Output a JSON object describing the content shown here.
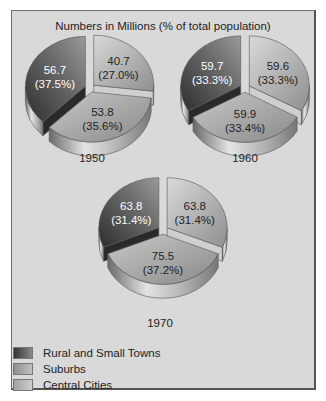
{
  "chart_data": {
    "type": "pie",
    "title": "Numbers in Millions (% of total population)",
    "legend_position": "bottom-left",
    "categories": [
      "Rural and Small Towns",
      "Suburbs",
      "Central Cities"
    ],
    "colors": {
      "Rural and Small Towns": "#4a4a4a",
      "Suburbs": "#a8a8a8",
      "Central Cities": "#bdbdbd"
    },
    "pies": [
      {
        "year": "1950",
        "values": [
          56.7,
          53.8,
          40.7
        ],
        "percents": [
          "37.5%",
          "35.6%",
          "27.0%"
        ]
      },
      {
        "year": "1960",
        "values": [
          59.7,
          59.9,
          59.6
        ],
        "percents": [
          "33.3%",
          "33.4%",
          "33.3%"
        ]
      },
      {
        "year": "1970",
        "values": [
          63.8,
          75.5,
          63.8
        ],
        "percents": [
          "31.4%",
          "37.2%",
          "31.4%"
        ]
      }
    ]
  },
  "title": "Numbers in Millions (% of total population)",
  "pies": [
    {
      "year": "1950",
      "rural": {
        "value": "56.7",
        "pct": "(37.5%)"
      },
      "suburbs": {
        "value": "53.8",
        "pct": "(35.6%)"
      },
      "central": {
        "value": "40.7",
        "pct": "(27.0%)"
      }
    },
    {
      "year": "1960",
      "rural": {
        "value": "59.7",
        "pct": "(33.3%)"
      },
      "suburbs": {
        "value": "59.9",
        "pct": "(33.4%)"
      },
      "central": {
        "value": "59.6",
        "pct": "(33.3%)"
      }
    },
    {
      "year": "1970",
      "rural": {
        "value": "63.8",
        "pct": "(31.4%)"
      },
      "suburbs": {
        "value": "75.5",
        "pct": "(37.2%)"
      },
      "central": {
        "value": "63.8",
        "pct": "(31.4%)"
      }
    }
  ],
  "legend": [
    {
      "label": "Rural and Small Towns",
      "color": "#4a4a4a"
    },
    {
      "label": "Suburbs",
      "color": "#a8a8a8"
    },
    {
      "label": "Central Cities",
      "color": "#bdbdbd"
    }
  ]
}
